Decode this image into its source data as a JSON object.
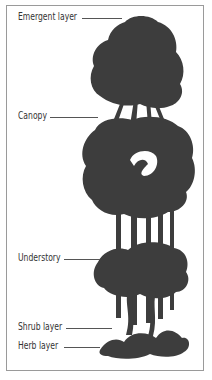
{
  "diagram": {
    "labels": [
      {
        "text": "Emergent layer"
      },
      {
        "text": "Canopy"
      },
      {
        "text": "Understory"
      },
      {
        "text": "Shrub layer"
      },
      {
        "text": "Herb layer"
      }
    ],
    "colors": {
      "tree": "#3b3b3b",
      "text": "#333333",
      "border": "#9a9a9a"
    }
  }
}
